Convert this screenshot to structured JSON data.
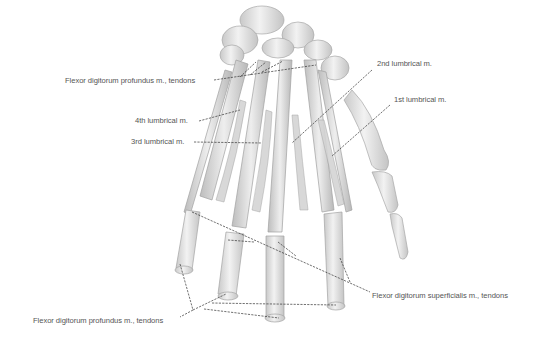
{
  "figure": {
    "labels": {
      "fdp_top": "Flexor digitorum profundus m., tendons",
      "lumbrical_4": "4th lumbrical m.",
      "lumbrical_3": "3rd lumbrical m.",
      "lumbrical_2": "2nd lumbrical m.",
      "lumbrical_1": "1st lumbrical m.",
      "fds": "Flexor digitorum superficialis m., tendons",
      "fdp_bottom": "Flexor digitorum profundus m., tendons"
    },
    "colors": {
      "background": "#ffffff",
      "bone": "#ececec",
      "bone_shade": "#bdbdbd",
      "tendon": "#e2e2e2",
      "muscle": "#cfcfcf",
      "leader_line": "#333333",
      "label_text": "#555555"
    }
  }
}
